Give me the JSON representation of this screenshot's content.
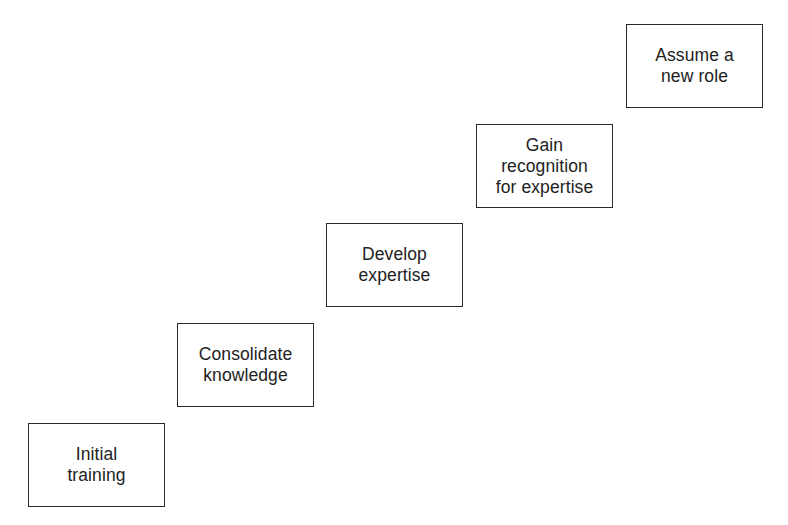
{
  "diagram": {
    "type": "staircase-progression",
    "steps": [
      {
        "label": "Initial\ntraining",
        "x": 28,
        "y": 423
      },
      {
        "label": "Consolidate\nknowledge",
        "x": 177,
        "y": 323
      },
      {
        "label": "Develop\nexpertise",
        "x": 326,
        "y": 223
      },
      {
        "label": "Gain\nrecognition\nfor expertise",
        "x": 476,
        "y": 124
      },
      {
        "label": "Assume a\nnew role",
        "x": 626,
        "y": 24
      }
    ],
    "colors": {
      "border": "#2a2a2a",
      "text": "#222222",
      "background": "#ffffff"
    }
  }
}
